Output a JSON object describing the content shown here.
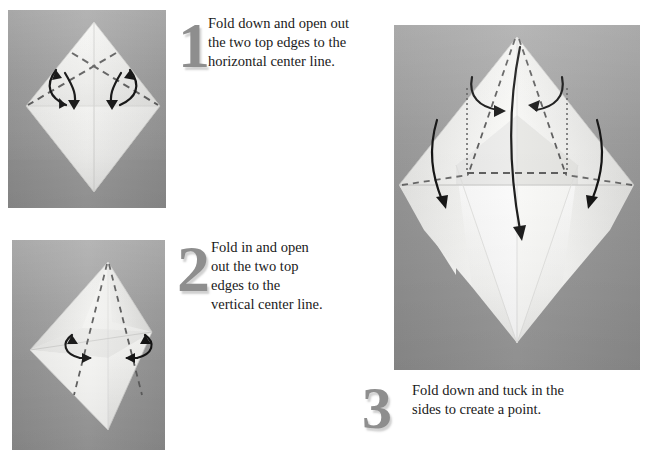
{
  "page": {
    "background_color": "#ffffff",
    "width": 656,
    "height": 459
  },
  "palette": {
    "photo_background_gray": "#9e9e9e",
    "paper_white": "#fdfdfd",
    "paper_shade_light": "#f0f0f0",
    "paper_shade_mid": "#dcdcdc",
    "paper_shade_dark": "#c6c6c6",
    "fold_line_gray": "#6b6b6b",
    "arrow_black": "#111111",
    "numeral_gray": "#8e8e8e",
    "text_black": "#1a1a1a"
  },
  "steps": [
    {
      "number": "1",
      "text": "Fold down and open out the two top edges to the horizontal center line.",
      "lines": [
        "Fold down and open out",
        "the two top edges to the",
        "horizontal center line."
      ],
      "photo": {
        "name": "origami-photo-step-1",
        "alt": "Square sheet rotated as a diamond with two crossing dashed fold lines near the top and two double-headed curved arrows",
        "fold_lines": [
          {
            "type": "dashed",
            "orientation": "diagonal-down-right"
          },
          {
            "type": "dashed",
            "orientation": "diagonal-down-left"
          }
        ],
        "arrows": [
          {
            "type": "double-headed-curved",
            "position": "left"
          },
          {
            "type": "double-headed-curved",
            "position": "right"
          }
        ]
      }
    },
    {
      "number": "2",
      "text": "Fold in and open out the two top edges to the vertical center line.",
      "lines": [
        "Fold in and open",
        "out the two top",
        "edges to the",
        "vertical center line."
      ],
      "photo": {
        "name": "origami-photo-step-2",
        "alt": "Diamond with top edges folded to the horizontal center, two near-vertical dashed lines converging at the top point, and two inward curved arrows",
        "fold_lines": [
          {
            "type": "dashed",
            "orientation": "near-vertical-left"
          },
          {
            "type": "dashed",
            "orientation": "near-vertical-right"
          }
        ],
        "arrows": [
          {
            "type": "double-headed-curved",
            "position": "left-inward"
          },
          {
            "type": "double-headed-curved",
            "position": "right-inward"
          }
        ]
      }
    },
    {
      "number": "3",
      "text": "Fold down and tuck in the sides to create a point.",
      "lines": [
        "Fold down and tuck in the",
        "sides to create a point."
      ],
      "photo": {
        "name": "origami-photo-step-3",
        "alt": "Large view of the folded paper forming a peaked shape with dotted vertical guide lines, dashed horizontal and diagonal fold lines, and curved arrows indicating tucking and folding down",
        "fold_lines": [
          {
            "type": "dotted",
            "orientation": "vertical-left-guide"
          },
          {
            "type": "dotted",
            "orientation": "vertical-right-guide"
          },
          {
            "type": "dashed",
            "orientation": "horizontal-center"
          },
          {
            "type": "dashed",
            "orientation": "diagonal-left-upper"
          },
          {
            "type": "dashed",
            "orientation": "diagonal-right-upper"
          },
          {
            "type": "dashed",
            "orientation": "diagonal-left-lower"
          },
          {
            "type": "dashed",
            "orientation": "diagonal-right-lower"
          }
        ],
        "arrows": [
          {
            "type": "curved",
            "position": "inner-left-to-center"
          },
          {
            "type": "curved",
            "position": "inner-right-to-center"
          },
          {
            "type": "curved",
            "position": "outer-left-down"
          },
          {
            "type": "curved",
            "position": "outer-right-down"
          },
          {
            "type": "long-curved",
            "position": "center-down"
          }
        ]
      }
    }
  ]
}
